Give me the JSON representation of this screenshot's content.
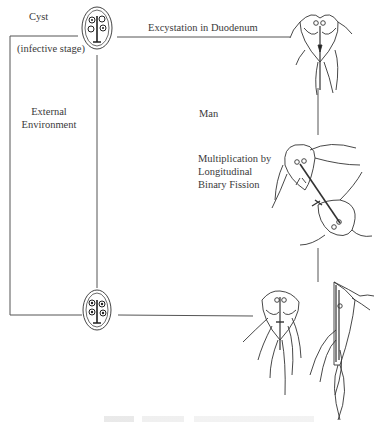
{
  "diagram": {
    "type": "life-cycle",
    "labels": {
      "cyst": "Cyst",
      "infective_stage": "(infective stage)",
      "excystation": "Excystation in Duodenum",
      "external_environment_1": "External",
      "external_environment_2": "Environment",
      "man": "Man",
      "multiplication_1": "Multiplication by",
      "multiplication_2": "Longitudinal",
      "multiplication_3": "Binary Fission"
    },
    "stages": [
      {
        "id": "cyst-top",
        "name": "Cyst (infective stage)"
      },
      {
        "id": "trophozoite-excystation",
        "name": "Trophozoite after excystation in duodenum"
      },
      {
        "id": "binary-fission",
        "name": "Multiplication by longitudinal binary fission"
      },
      {
        "id": "trophozoite-front",
        "name": "Trophozoite (front view)"
      },
      {
        "id": "trophozoite-side",
        "name": "Trophozoite (side view)"
      },
      {
        "id": "cyst-bottom",
        "name": "Cyst passed to external environment"
      }
    ],
    "line_color": "#555555"
  }
}
